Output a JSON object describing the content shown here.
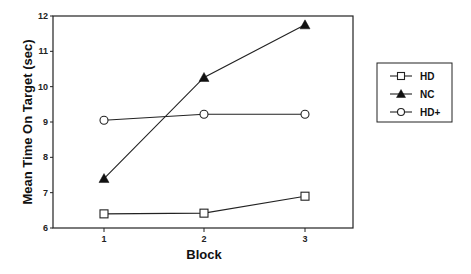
{
  "chart_data": {
    "type": "line",
    "title": "",
    "xlabel": "Block",
    "ylabel": "Mean Time On Target (sec)",
    "x": [
      1,
      2,
      3
    ],
    "x_tick_labels": [
      "1",
      "2",
      "3"
    ],
    "y_tick_labels": [
      "6",
      "7",
      "8",
      "9",
      "10",
      "11",
      "12"
    ],
    "ylim": [
      6,
      12
    ],
    "grid": false,
    "legend_position": "right",
    "series": [
      {
        "name": "HD",
        "marker": "open-square",
        "values": [
          6.4,
          6.42,
          6.9
        ]
      },
      {
        "name": "NC",
        "marker": "filled-triangle",
        "values": [
          7.4,
          10.26,
          11.75
        ]
      },
      {
        "name": "HD+",
        "marker": "open-circle",
        "values": [
          9.05,
          9.22,
          9.22
        ]
      }
    ]
  }
}
